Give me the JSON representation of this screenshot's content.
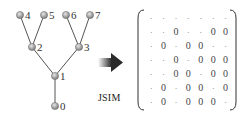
{
  "tree": {
    "nodes": [
      {
        "id": "0",
        "label": "0",
        "x": 55,
        "y": 106
      },
      {
        "id": "1",
        "label": "1",
        "x": 55,
        "y": 76
      },
      {
        "id": "2",
        "label": "2",
        "x": 32,
        "y": 47
      },
      {
        "id": "3",
        "label": "3",
        "x": 79,
        "y": 47
      },
      {
        "id": "4",
        "label": "4",
        "x": 20,
        "y": 15
      },
      {
        "id": "5",
        "label": "5",
        "x": 44,
        "y": 15
      },
      {
        "id": "6",
        "label": "6",
        "x": 66,
        "y": 15
      },
      {
        "id": "7",
        "label": "7",
        "x": 90,
        "y": 15
      }
    ],
    "edges": [
      [
        "0",
        "1"
      ],
      [
        "1",
        "2"
      ],
      [
        "1",
        "3"
      ],
      [
        "2",
        "4"
      ],
      [
        "2",
        "5"
      ],
      [
        "3",
        "6"
      ],
      [
        "3",
        "7"
      ]
    ],
    "node_color": "#9a9a9a",
    "edge_color": "#555555"
  },
  "arrow": {
    "color": "#333333"
  },
  "matrix": {
    "label": "JSIM",
    "rows": [
      [
        "·",
        "·",
        "·",
        "·",
        "·",
        "·",
        "·"
      ],
      [
        "·",
        "·",
        "0",
        "·",
        "·",
        "0",
        "0"
      ],
      [
        "·",
        "0",
        "·",
        "0",
        "0",
        "·",
        "·"
      ],
      [
        "·",
        "·",
        "0",
        "·",
        "0",
        "0",
        "0"
      ],
      [
        "·",
        "·",
        "0",
        "0",
        "·",
        "0",
        "0"
      ],
      [
        "·",
        "0",
        "·",
        "0",
        "0",
        "·",
        "0"
      ],
      [
        "·",
        "0",
        "·",
        "0",
        "0",
        "0",
        "·"
      ]
    ]
  }
}
